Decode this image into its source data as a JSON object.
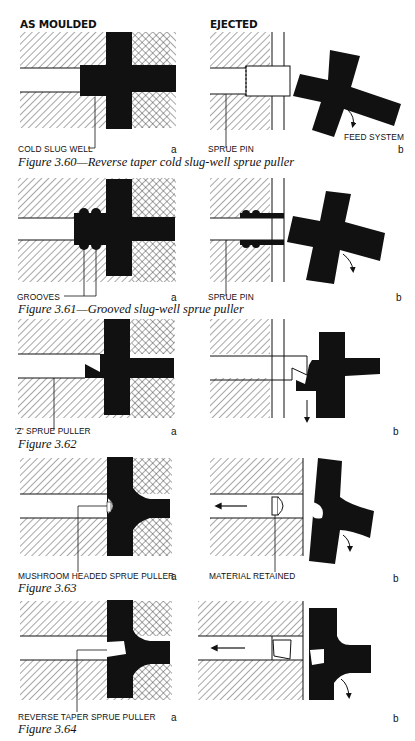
{
  "headers": {
    "left": "AS MOULDED",
    "right": "EJECTED"
  },
  "figures": [
    {
      "id": "3.60",
      "caption": "Figure 3.60—Reverse taper cold slug-well sprue puller",
      "labels": {
        "a_label": "COLD SLUG WELL",
        "b_label": "SPRUE PIN",
        "b_extra": "FEED SYSTEM"
      },
      "sub_a": "a",
      "sub_b": "b"
    },
    {
      "id": "3.61",
      "caption": "Figure 3.61—Grooved slug-well sprue puller",
      "labels": {
        "a_label": "GROOVES",
        "b_label": "SPRUE PIN"
      },
      "sub_a": "a",
      "sub_b": "b"
    },
    {
      "id": "3.62",
      "caption": "Figure 3.62",
      "labels": {
        "a_label": "'Z' SPRUE PULLER"
      },
      "sub_a": "a",
      "sub_b": "b"
    },
    {
      "id": "3.63",
      "caption": "Figure 3.63",
      "labels": {
        "a_label": "MUSHROOM HEADED SPRUE PULLER",
        "b_label": "MATERIAL RETAINED"
      },
      "sub_a": "a",
      "sub_b": "b"
    },
    {
      "id": "3.64",
      "caption": "Figure 3.64",
      "labels": {
        "a_label": "REVERSE TAPER SPRUE PULLER"
      },
      "sub_a": "a",
      "sub_b": "b"
    }
  ],
  "colors": {
    "ink": "#111111",
    "paper": "#ffffff"
  }
}
